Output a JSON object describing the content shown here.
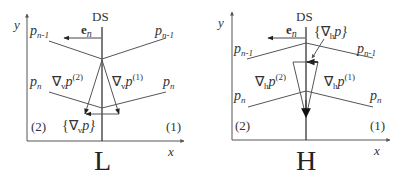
{
  "panels": [
    {
      "id": "L",
      "caption": "L",
      "axis_x_label": "x",
      "axis_y_label": "y",
      "interface_label": "DS",
      "normal_label": "e",
      "normal_sub": "n",
      "line_labels": {
        "upper_left": "p",
        "upper_left_sub": "n-1",
        "upper_right": "p",
        "upper_right_sub": "n-1",
        "lower_left": "p",
        "lower_left_sub": "n",
        "lower_right": "p",
        "lower_right_sub": "n"
      },
      "grad_left": "∇",
      "grad_left_sub": "v",
      "grad_left_p": "p",
      "grad_left_sup": "(2)",
      "grad_right": "∇",
      "grad_right_sub": "v",
      "grad_right_p": "p",
      "grad_right_sup": "(1)",
      "avg_label_open": "{∇",
      "avg_label_sub": "v",
      "avg_label_close": "p}",
      "region_left": "(2)",
      "region_right": "(1)"
    },
    {
      "id": "H",
      "caption": "H",
      "axis_x_label": "x",
      "axis_y_label": "y",
      "interface_label": "DS",
      "normal_label": "e",
      "normal_sub": "n",
      "line_labels": {
        "upper_left": "p",
        "upper_left_sub": "n-1",
        "upper_right": "p",
        "upper_right_sub": "n-1",
        "lower_left": "p",
        "lower_left_sub": "n",
        "lower_right": "p",
        "lower_right_sub": "n"
      },
      "grad_left": "∇",
      "grad_left_sub": "h",
      "grad_left_p": "p",
      "grad_left_sup": "(2)",
      "grad_right": "∇",
      "grad_right_sub": "h",
      "grad_right_p": "p",
      "grad_right_sup": "(1)",
      "avg_label_open": "{∇",
      "avg_label_sub": "h",
      "avg_label_close": "p}",
      "region_left": "(2)",
      "region_right": "(1)"
    }
  ]
}
